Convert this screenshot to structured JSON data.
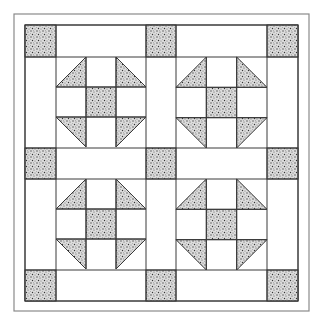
{
  "diagram": {
    "colors": {
      "line": "#3a3a3a",
      "border": "#8a8a8a",
      "fabric": "#ffffff",
      "speckle_bg": "#d9d9d9",
      "speckle_dot": "#555555"
    },
    "outer_border": {
      "x": 14,
      "y": 14,
      "w": 295,
      "h": 297
    },
    "grid": {
      "cols": [
        25,
        56,
        146,
        176,
        267,
        298
      ],
      "rows": [
        25,
        57,
        148,
        179,
        270,
        301
      ]
    },
    "cornerstones": 9,
    "blocks": [
      {
        "name": "block-top-left",
        "x": 56,
        "y": 57,
        "size": 90
      },
      {
        "name": "block-top-right",
        "x": 176,
        "y": 57,
        "size": 91
      },
      {
        "name": "block-bottom-left",
        "x": 56,
        "y": 179,
        "size": 90
      },
      {
        "name": "block-bottom-right",
        "x": 176,
        "y": 179,
        "size": 91
      }
    ]
  }
}
